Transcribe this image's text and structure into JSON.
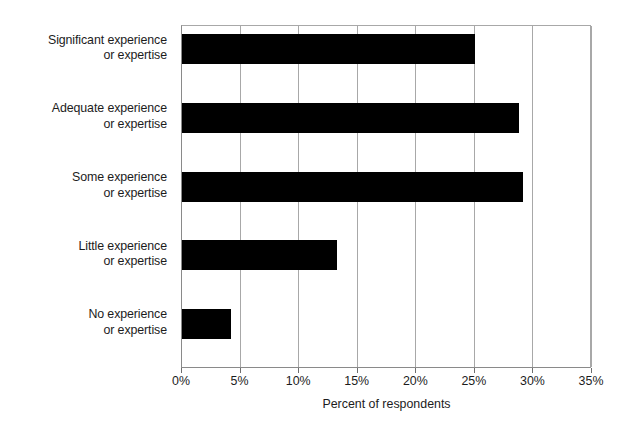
{
  "chart_data": {
    "type": "bar",
    "orientation": "horizontal",
    "title": "",
    "xlabel": "Percent of respondents",
    "ylabel": "",
    "categories": [
      "Significant experience or expertise",
      "Adequate experience or expertise",
      "Some experience or expertise",
      "Little experience or expertise",
      "No experience or expertise"
    ],
    "category_lines": [
      [
        "Significant experience",
        "or expertise"
      ],
      [
        "Adequate experience",
        "or expertise"
      ],
      [
        "Some experience",
        "or expertise"
      ],
      [
        "Little experience",
        "or expertise"
      ],
      [
        "No experience",
        "or expertise"
      ]
    ],
    "values": [
      25.0,
      28.8,
      29.1,
      13.2,
      4.2
    ],
    "xlim": [
      0,
      35
    ],
    "xticks": [
      0,
      5,
      10,
      15,
      20,
      25,
      30,
      35
    ],
    "xtick_labels": [
      "0%",
      "5%",
      "10%",
      "15%",
      "20%",
      "25%",
      "30%",
      "35%"
    ],
    "grid": true,
    "grid_axis": "x",
    "legend": false,
    "bar_color": "#000000",
    "grid_color": "#a8a8a8",
    "axis_color": "#8a8a8a",
    "background": "#ffffff"
  }
}
